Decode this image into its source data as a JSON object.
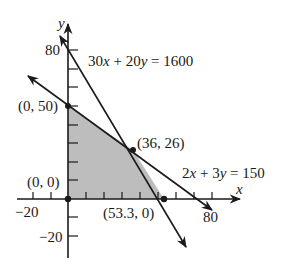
{
  "figure": {
    "type": "feasible-region-graph",
    "axes": {
      "x_label": "x",
      "y_label": "y",
      "x_tick_labels": [
        "−20",
        "80"
      ],
      "y_tick_labels": [
        "80",
        "−20"
      ],
      "x_range": [
        -28,
        96
      ],
      "y_range": [
        -32,
        94
      ]
    },
    "lines": [
      {
        "equation": "30x + 20y = 1600",
        "label": "30x + 20y = 1600"
      },
      {
        "equation": "2x + 3y = 150",
        "label": "2x + 3y = 150"
      }
    ],
    "vertices": [
      {
        "label": "(0, 0)",
        "x": 0,
        "y": 0
      },
      {
        "label": "(0, 50)",
        "x": 0,
        "y": 50
      },
      {
        "label": "(36, 26)",
        "x": 36,
        "y": 26
      },
      {
        "label": "(53.3, 0)",
        "x": 53.3,
        "y": 0
      }
    ],
    "region": {
      "fill": "#b8b8b8",
      "description": "shaded feasible region"
    },
    "colors": {
      "line": "#1a1a1a",
      "region": "#bdbdbd",
      "background": "#ffffff"
    }
  }
}
